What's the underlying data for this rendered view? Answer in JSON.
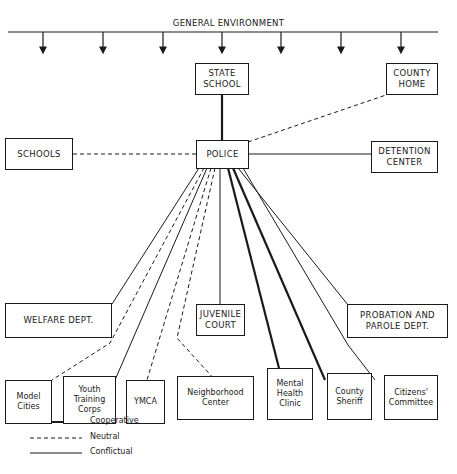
{
  "environment": {
    "title": "GENERAL ENVIRONMENT",
    "arrow_count": 7
  },
  "nodes": {
    "police": "POLICE",
    "state_school": "STATE\nSCHOOL",
    "county_home": "COUNTY\nHOME",
    "schools": "SCHOOLS",
    "detention_center": "DETENTION\nCENTER",
    "welfare_dept": "WELFARE DEPT.",
    "juvenile_court": "JUVENILE\nCOURT",
    "probation_parole": "PROBATION AND\nPAROLE DEPT.",
    "model_cities": "Model\nCities",
    "youth_training_corps": "Youth\nTraining\nCorps",
    "ymca": "YMCA",
    "neighborhood_center": "Neighborhood\nCenter",
    "mental_health_clinic": "Mental\nHealth\nClinic",
    "county_sheriff": "County\nSheriff",
    "citizens_committee": "Citizens'\nCommittee"
  },
  "relationships": [
    {
      "from": "POLICE",
      "to": "STATE SCHOOL",
      "type": "Cooperative"
    },
    {
      "from": "POLICE",
      "to": "COUNTY HOME",
      "type": "Neutral"
    },
    {
      "from": "POLICE",
      "to": "SCHOOLS",
      "type": "Neutral"
    },
    {
      "from": "POLICE",
      "to": "DETENTION CENTER",
      "type": "Conflictual"
    },
    {
      "from": "POLICE",
      "to": "WELFARE DEPT.",
      "type": "Conflictual"
    },
    {
      "from": "POLICE",
      "to": "Model Cities",
      "type": "Neutral"
    },
    {
      "from": "POLICE",
      "to": "Youth Training Corps",
      "type": "Conflictual"
    },
    {
      "from": "POLICE",
      "to": "YMCA",
      "type": "Neutral"
    },
    {
      "from": "POLICE",
      "to": "Neighborhood Center",
      "type": "Neutral"
    },
    {
      "from": "POLICE",
      "to": "JUVENILE COURT",
      "type": "Conflictual"
    },
    {
      "from": "POLICE",
      "to": "Mental Health Clinic",
      "type": "Cooperative"
    },
    {
      "from": "POLICE",
      "to": "County Sheriff",
      "type": "Cooperative"
    },
    {
      "from": "POLICE",
      "to": "PROBATION AND PAROLE DEPT.",
      "type": "Conflictual"
    },
    {
      "from": "POLICE",
      "to": "Citizens' Committee",
      "type": "Conflictual"
    }
  ],
  "legend": {
    "cooperative": "Cooperative",
    "neutral": "Neutral",
    "conflictual": "Conflictual"
  }
}
